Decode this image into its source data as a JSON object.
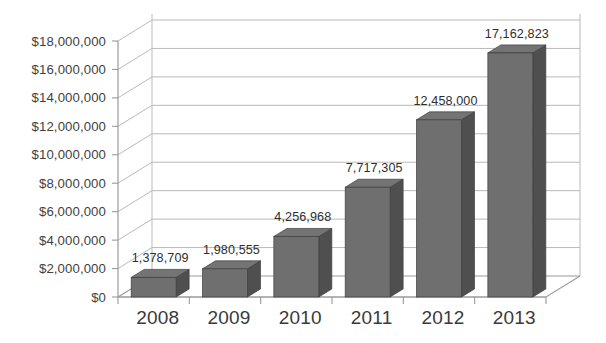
{
  "chart_data": {
    "type": "bar",
    "title": "",
    "subtitle": "",
    "xlabel": "",
    "ylabel": "",
    "categories": [
      "2008",
      "2009",
      "2010",
      "2011",
      "2012",
      "2013"
    ],
    "values": [
      1378709,
      1980555,
      4256968,
      7717305,
      12458000,
      17162823
    ],
    "data_labels": [
      "1,378,709",
      "1,980,555",
      "4,256,968",
      "7,717,305",
      "12,458,000",
      "17,162,823"
    ],
    "series": [
      {
        "name": "",
        "values": [
          1378709,
          1980555,
          4256968,
          7717305,
          12458000,
          17162823
        ]
      }
    ],
    "ylim": [
      0,
      18000000
    ],
    "ytick_values": [
      0,
      2000000,
      4000000,
      6000000,
      8000000,
      10000000,
      12000000,
      14000000,
      16000000,
      18000000
    ],
    "ytick_labels": [
      "$0",
      "$2,000,000",
      "$4,000,000",
      "$6,000,000",
      "$8,000,000",
      "$10,000,000",
      "$12,000,000",
      "$14,000,000",
      "$16,000,000",
      "$18,000,000"
    ],
    "grid": true,
    "legend": false,
    "legend_position": "none",
    "three_d": true,
    "colors": {
      "bar_front": "#6f6f6f",
      "bar_top": "#747474",
      "bar_side": "#4f4f4f",
      "bar_edge": "#3d3d3d",
      "gridline": "#b9b9b9",
      "axis": "#9a9a9a",
      "label_text": "#3f3f3f",
      "category_text": "#3a3a3a",
      "datalabel_text": "#2e2e2e",
      "background": "#ffffff"
    }
  }
}
